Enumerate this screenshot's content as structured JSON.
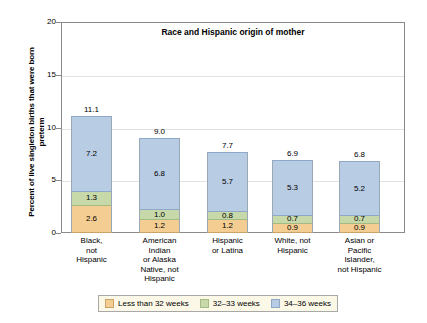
{
  "chart_data": {
    "type": "bar",
    "stacked": true,
    "title": "Race and Hispanic origin of mother",
    "xlabel": "",
    "ylabel": "Percent of live singleton births that were born preterm",
    "ylim": [
      0,
      20
    ],
    "yticks": [
      0,
      5,
      10,
      15,
      20
    ],
    "grid": true,
    "legend_position": "bottom",
    "categories": [
      "Black, not Hispanic",
      "American Indian or Alaska Native, not Hispanic",
      "Hispanic or Latina",
      "White, not Hispanic",
      "Asian or Pacific Islander, not Hispanic"
    ],
    "category_lines": [
      [
        "Black,",
        "not",
        "Hispanic"
      ],
      [
        "American",
        "Indian",
        "or Alaska",
        "Native, not",
        "Hispanic"
      ],
      [
        "Hispanic",
        "or Latina"
      ],
      [
        "White, not",
        "Hispanic"
      ],
      [
        "Asian or",
        "Pacific",
        "Islander,",
        "not Hispanic"
      ]
    ],
    "series": [
      {
        "name": "Less than 32 weeks",
        "color": "#f3cd92",
        "values": [
          2.6,
          1.2,
          1.2,
          0.9,
          0.9
        ]
      },
      {
        "name": "32–33 weeks",
        "color": "#c7d9a8",
        "values": [
          1.3,
          1.0,
          0.8,
          0.7,
          0.7
        ]
      },
      {
        "name": "34–36 weeks",
        "color": "#b8cce4",
        "values": [
          7.2,
          6.8,
          5.7,
          5.3,
          5.2
        ]
      }
    ],
    "totals": [
      11.1,
      9.0,
      7.7,
      6.9,
      6.8
    ],
    "legend": [
      "Less than 32 weeks",
      "32–33 weeks",
      "34–36 weeks"
    ]
  },
  "axis": {
    "tick_labels": [
      "0",
      "5",
      "10",
      "15",
      "20"
    ]
  }
}
